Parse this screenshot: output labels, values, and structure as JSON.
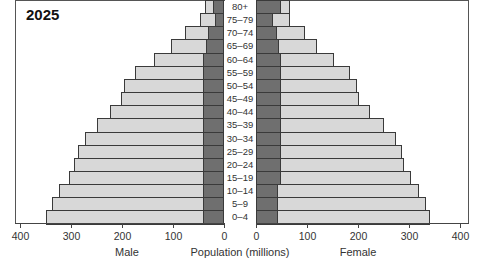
{
  "chart_data": {
    "type": "bar",
    "subtype": "population-pyramid",
    "title": "2025",
    "xlabel": "Population (millions)",
    "left_label": "Male",
    "right_label": "Female",
    "xlim": [
      0,
      400
    ],
    "ticks": [
      400,
      300,
      200,
      100,
      0
    ],
    "categories": [
      "80+",
      "75–79",
      "70–74",
      "65–69",
      "60–64",
      "55–59",
      "50–54",
      "45–49",
      "40–44",
      "35–39",
      "30–34",
      "25–29",
      "20–24",
      "15–19",
      "10–14",
      "5–9",
      "0–4"
    ],
    "series": [
      {
        "name": "Male",
        "values": [
          37,
          47,
          76,
          104,
          137,
          175,
          196,
          202,
          224,
          249,
          273,
          286,
          294,
          304,
          324,
          337,
          349
        ]
      },
      {
        "name": "Female",
        "values": [
          67,
          67,
          96,
          120,
          153,
          184,
          198,
          202,
          224,
          251,
          275,
          286,
          290,
          304,
          320,
          333,
          341
        ]
      },
      {
        "name": "Male (dark inner segment)",
        "values": [
          22,
          18,
          31,
          35,
          41,
          41,
          41,
          41,
          41,
          41,
          41,
          41,
          41,
          41,
          41,
          41,
          41
        ]
      },
      {
        "name": "Female (dark inner segment)",
        "values": [
          49,
          33,
          41,
          45,
          49,
          49,
          49,
          49,
          49,
          49,
          49,
          49,
          49,
          49,
          43,
          43,
          43
        ]
      }
    ],
    "colors": {
      "light": "#d8d8d8",
      "dark": "#6f6f6f",
      "border": "#3a3a3a"
    },
    "grid": false,
    "legend": "none"
  },
  "labels": {
    "year": "2025",
    "male": "Male",
    "female": "Female",
    "axis": "Population (millions)",
    "male_ticks": [
      "400",
      "300",
      "200",
      "100",
      "0"
    ],
    "female_ticks": [
      "0",
      "100",
      "200",
      "300",
      "400"
    ]
  }
}
